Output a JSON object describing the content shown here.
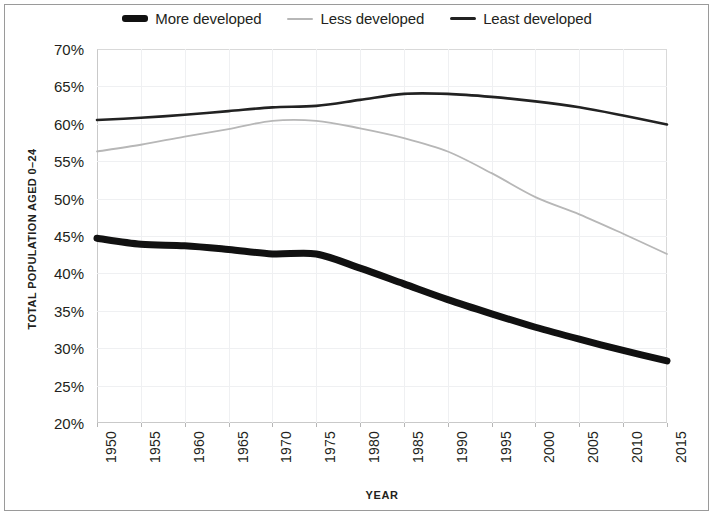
{
  "chart_data": {
    "type": "line",
    "title": "",
    "subtitle": "",
    "xlabel": "YEAR",
    "ylabel": "TOTAL POPULATION AGED 0–24",
    "xlim": [
      1950,
      2015
    ],
    "ylim": [
      20,
      70
    ],
    "ytick_labels": [
      "70%",
      "65%",
      "60%",
      "55%",
      "50%",
      "45%",
      "40%",
      "35%",
      "30%",
      "25%",
      "20%"
    ],
    "ytick_values": [
      70,
      65,
      60,
      55,
      50,
      45,
      40,
      35,
      30,
      25,
      20
    ],
    "xtick_labels": [
      "1950",
      "1955",
      "1960",
      "1965",
      "1970",
      "1975",
      "1980",
      "1985",
      "1990",
      "1995",
      "2000",
      "2005",
      "2010",
      "2015"
    ],
    "x": [
      1950,
      1955,
      1960,
      1965,
      1970,
      1975,
      1980,
      1985,
      1990,
      1995,
      2000,
      2005,
      2010,
      2015
    ],
    "grid": true,
    "legend_position": "top-center",
    "series": [
      {
        "name": "More developed",
        "color": "#111111",
        "width": 7,
        "values": [
          44.7,
          43.9,
          43.7,
          43.2,
          42.6,
          42.6,
          40.7,
          38.6,
          36.5,
          34.6,
          32.8,
          31.2,
          29.7,
          28.3
        ]
      },
      {
        "name": "Less developed",
        "color": "#b7b7b7",
        "width": 1.8,
        "values": [
          56.3,
          57.2,
          58.3,
          59.3,
          60.4,
          60.4,
          59.4,
          58.1,
          56.3,
          53.4,
          50.2,
          47.9,
          45.3,
          42.6
        ]
      },
      {
        "name": "Least developed",
        "color": "#222222",
        "width": 2.6,
        "values": [
          60.5,
          60.8,
          61.2,
          61.7,
          62.2,
          62.4,
          63.2,
          64.0,
          64.0,
          63.6,
          63.0,
          62.2,
          61.1,
          59.9
        ]
      }
    ]
  },
  "legend": {
    "items": [
      {
        "label": "More developed",
        "swatch": "thick-black-line-swatch"
      },
      {
        "label": "Less developed",
        "swatch": "thin-gray-line-swatch"
      },
      {
        "label": "Least developed",
        "swatch": "medium-black-line-swatch"
      }
    ]
  },
  "axes": {
    "y_title": "TOTAL POPULATION AGED 0–24",
    "x_title": "YEAR"
  }
}
